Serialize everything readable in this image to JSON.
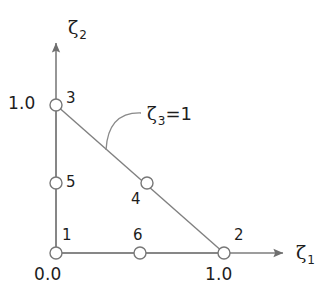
{
  "figure": {
    "background_color": "#ffffff",
    "line_color": "#808080",
    "node_stroke_color": "#777777",
    "node_fill_color": "#ffffff",
    "text_color": "#1d1d1d"
  },
  "axes": {
    "x": {
      "label_symbol": "ζ",
      "label_subscript": "1",
      "arrow_tip_x": 287,
      "arrow_tip_y": 253,
      "origin_x": 56,
      "origin_y": 253
    },
    "y": {
      "label_symbol": "ζ",
      "label_subscript": "2",
      "arrow_tip_x": 56,
      "arrow_tip_y": 38,
      "origin_x": 56,
      "origin_y": 253
    }
  },
  "tick_labels": [
    {
      "name": "x-origin-tick",
      "text": "0.0",
      "x": 34,
      "y": 266
    },
    {
      "name": "x-one-tick",
      "text": "1.0",
      "x": 205,
      "y": 266
    },
    {
      "name": "y-one-tick",
      "text": "1.0",
      "x": 8,
      "y": 95
    }
  ],
  "nodes": [
    {
      "id": "1",
      "label": "1",
      "cx": 56,
      "cy": 253,
      "r": 6,
      "label_x": 62,
      "label_y": 228,
      "zeta1": 0.0,
      "zeta2": 0.0,
      "zeta3": 1.0,
      "kind": "corner"
    },
    {
      "id": "2",
      "label": "2",
      "cx": 224,
      "cy": 253,
      "r": 6,
      "label_x": 234,
      "label_y": 228,
      "zeta1": 1.0,
      "zeta2": 0.0,
      "zeta3": 0.0,
      "kind": "corner"
    },
    {
      "id": "3",
      "label": "3",
      "cx": 56,
      "cy": 105,
      "r": 6,
      "label_x": 66,
      "label_y": 91,
      "zeta1": 0.0,
      "zeta2": 1.0,
      "zeta3": 0.0,
      "kind": "corner"
    },
    {
      "id": "4",
      "label": "4",
      "cx": 147,
      "cy": 183,
      "r": 6,
      "label_x": 131,
      "label_y": 192,
      "zeta1": 0.5,
      "zeta2": 0.5,
      "zeta3": 0.0,
      "kind": "midside"
    },
    {
      "id": "5",
      "label": "5",
      "cx": 56,
      "cy": 183,
      "r": 6,
      "label_x": 66,
      "label_y": 175,
      "zeta1": 0.0,
      "zeta2": 0.5,
      "zeta3": 0.5,
      "kind": "midside"
    },
    {
      "id": "6",
      "label": "6",
      "cx": 140,
      "cy": 253,
      "r": 6,
      "label_x": 133,
      "label_y": 228,
      "zeta1": 0.5,
      "zeta2": 0.0,
      "zeta3": 0.5,
      "kind": "midside"
    }
  ],
  "edges": [
    {
      "name": "edge-1-2-bottom",
      "x1": 56,
      "y1": 253,
      "x2": 224,
      "y2": 253
    },
    {
      "name": "edge-1-3-left",
      "x1": 56,
      "y1": 253,
      "x2": 56,
      "y2": 105
    },
    {
      "name": "edge-3-2-hypotenuse",
      "x1": 56,
      "y1": 105,
      "x2": 224,
      "y2": 253
    }
  ],
  "annotation": {
    "name": "zeta3-equals-one",
    "symbol": "ζ",
    "subscript": "3",
    "equals_value": "=1",
    "text_x": 147,
    "text_y": 105,
    "leader_start_x": 106,
    "leader_start_y": 150,
    "leader_end_x": 141,
    "leader_end_y": 113,
    "leader_control_x": 108,
    "leader_control_y": 112
  }
}
